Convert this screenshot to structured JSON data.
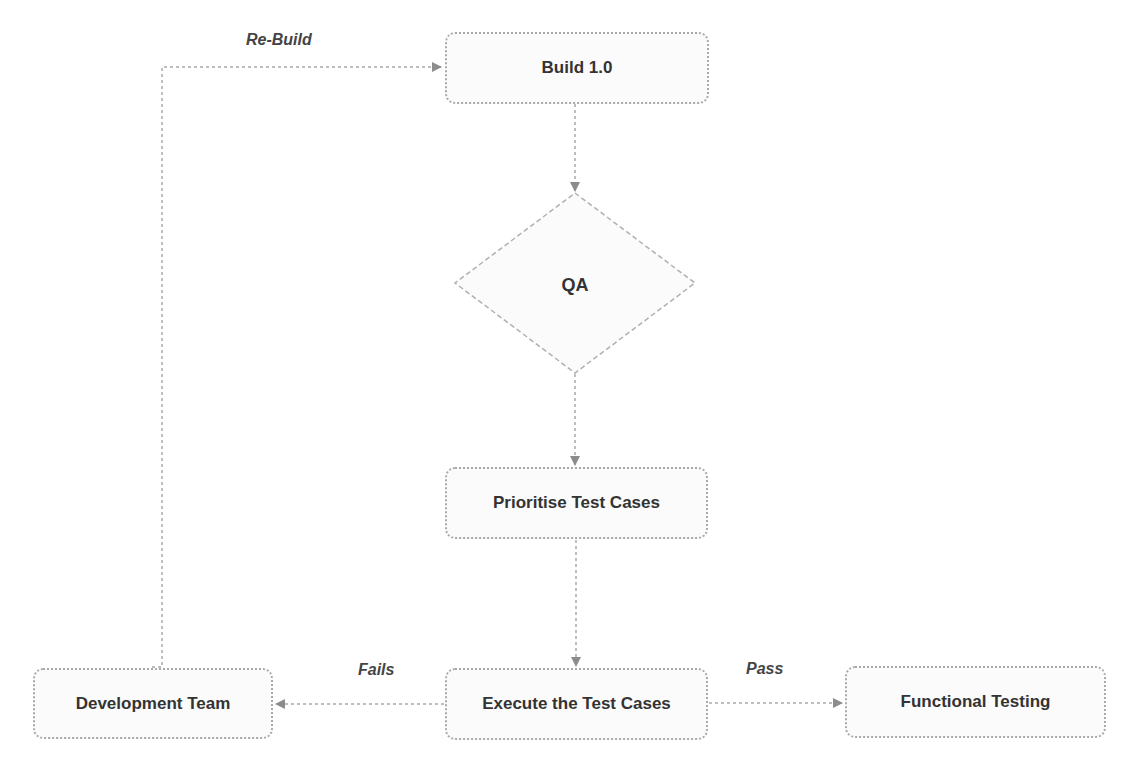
{
  "diagram": {
    "type": "flowchart",
    "nodes": {
      "build": {
        "label": "Build 1.0",
        "shape": "rounded-rect"
      },
      "qa": {
        "label": "QA",
        "shape": "diamond"
      },
      "prioritise": {
        "label": "Prioritise Test Cases",
        "shape": "rounded-rect"
      },
      "execute": {
        "label": "Execute the Test Cases",
        "shape": "rounded-rect"
      },
      "dev_team": {
        "label": "Development Team",
        "shape": "rounded-rect"
      },
      "functional": {
        "label": "Functional Testing",
        "shape": "rounded-rect"
      }
    },
    "edges": [
      {
        "from": "build",
        "to": "qa",
        "label": ""
      },
      {
        "from": "qa",
        "to": "prioritise",
        "label": ""
      },
      {
        "from": "prioritise",
        "to": "execute",
        "label": ""
      },
      {
        "from": "execute",
        "to": "dev_team",
        "label": "Fails"
      },
      {
        "from": "execute",
        "to": "functional",
        "label": "Pass"
      },
      {
        "from": "dev_team",
        "to": "build",
        "label": "Re-Build"
      }
    ],
    "edge_labels": {
      "rebuild": "Re-Build",
      "fails": "Fails",
      "pass": "Pass"
    },
    "colors": {
      "border": "#a9a9a9",
      "arrow": "#8c8c8c",
      "text": "#333333"
    }
  }
}
